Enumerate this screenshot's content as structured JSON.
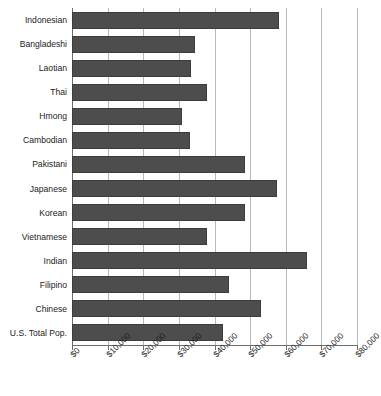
{
  "chart_data": {
    "type": "bar",
    "orientation": "horizontal",
    "title": "",
    "subtitle": "",
    "xlabel": "",
    "ylabel": "",
    "xlim": [
      0,
      80000
    ],
    "grid": true,
    "legend": false,
    "legend_position": "none",
    "bar_color": "#4d4d4d",
    "gridline_color": "#b9b9b9",
    "axis_color": "#6d6d6d",
    "categories": [
      "Indonesian",
      "Bangladeshi",
      "Laotian",
      "Thai",
      "Hmong",
      "Cambodian",
      "Pakistani",
      "Japanese",
      "Korean",
      "Vietnamese",
      "Indian",
      "Filipino",
      "Chinese",
      "U.S. Total Pop."
    ],
    "values": [
      58000,
      34500,
      33500,
      38000,
      31000,
      33000,
      48500,
      57500,
      48500,
      38000,
      66000,
      44000,
      53000,
      42500
    ],
    "tick_values": [
      0,
      10000,
      20000,
      30000,
      40000,
      50000,
      60000,
      70000,
      80000
    ],
    "tick_labels": [
      "$0",
      "$10,000",
      "$20,000",
      "$30,000",
      "$40,000",
      "$50,000",
      "$60,000",
      "$70,000",
      "$80,000"
    ]
  }
}
